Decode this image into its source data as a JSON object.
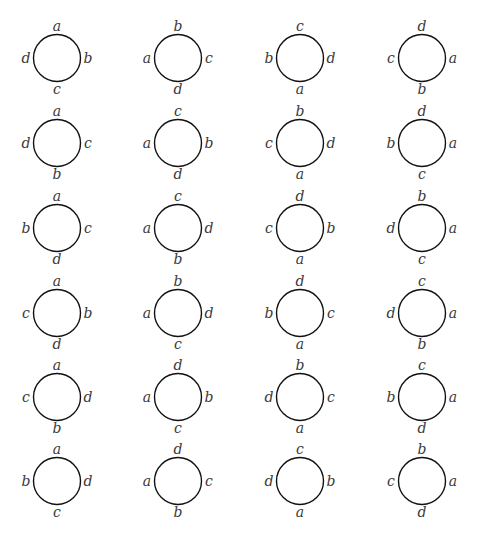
{
  "figure": {
    "rows": 6,
    "columns": 4,
    "colors": {
      "stroke": "#111111",
      "label": "#3a3a3a",
      "background": "#ffffff"
    },
    "circles": [
      [
        {
          "top": "a",
          "right": "b",
          "bottom": "c",
          "left": "d"
        },
        {
          "top": "b",
          "right": "c",
          "bottom": "d",
          "left": "a"
        },
        {
          "top": "c",
          "right": "d",
          "bottom": "a",
          "left": "b"
        },
        {
          "top": "d",
          "right": "a",
          "bottom": "b",
          "left": "c"
        }
      ],
      [
        {
          "top": "a",
          "right": "c",
          "bottom": "b",
          "left": "d"
        },
        {
          "top": "c",
          "right": "b",
          "bottom": "d",
          "left": "a"
        },
        {
          "top": "b",
          "right": "d",
          "bottom": "a",
          "left": "c"
        },
        {
          "top": "d",
          "right": "a",
          "bottom": "c",
          "left": "b"
        }
      ],
      [
        {
          "top": "a",
          "right": "c",
          "bottom": "d",
          "left": "b"
        },
        {
          "top": "c",
          "right": "d",
          "bottom": "b",
          "left": "a"
        },
        {
          "top": "d",
          "right": "b",
          "bottom": "a",
          "left": "c"
        },
        {
          "top": "b",
          "right": "a",
          "bottom": "c",
          "left": "d"
        }
      ],
      [
        {
          "top": "a",
          "right": "b",
          "bottom": "d",
          "left": "c"
        },
        {
          "top": "b",
          "right": "d",
          "bottom": "c",
          "left": "a"
        },
        {
          "top": "d",
          "right": "c",
          "bottom": "a",
          "left": "b"
        },
        {
          "top": "c",
          "right": "a",
          "bottom": "b",
          "left": "d"
        }
      ],
      [
        {
          "top": "a",
          "right": "d",
          "bottom": "b",
          "left": "c"
        },
        {
          "top": "d",
          "right": "b",
          "bottom": "c",
          "left": "a"
        },
        {
          "top": "b",
          "right": "c",
          "bottom": "a",
          "left": "d"
        },
        {
          "top": "c",
          "right": "a",
          "bottom": "d",
          "left": "b"
        }
      ],
      [
        {
          "top": "a",
          "right": "d",
          "bottom": "c",
          "left": "b"
        },
        {
          "top": "d",
          "right": "c",
          "bottom": "b",
          "left": "a"
        },
        {
          "top": "c",
          "right": "b",
          "bottom": "a",
          "left": "d"
        },
        {
          "top": "b",
          "right": "a",
          "bottom": "d",
          "left": "c"
        }
      ]
    ]
  }
}
